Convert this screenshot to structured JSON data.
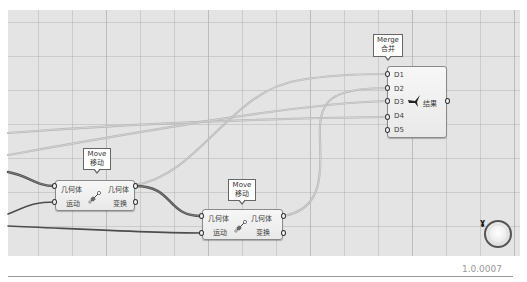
{
  "canvas": {
    "background": "#e4e4e4",
    "grid_color": "#a0a0a0"
  },
  "nodes": {
    "merge": {
      "tooltip_line1": "Merge",
      "tooltip_line2": "合并",
      "inputs": [
        "D1",
        "D2",
        "D3",
        "D4",
        "D5"
      ],
      "output": "结果",
      "icon": "merge-icon"
    },
    "move1": {
      "tooltip_line1": "Move",
      "tooltip_line2": "移动",
      "inputs": [
        "几何体",
        "运动"
      ],
      "outputs": [
        "几何体",
        "变换"
      ],
      "icon": "move-icon"
    },
    "move2": {
      "tooltip_line1": "Move",
      "tooltip_line2": "移动",
      "inputs": [
        "几何体",
        "运动"
      ],
      "outputs": [
        "几何体",
        "变换"
      ],
      "icon": "move-icon"
    }
  },
  "wires": {
    "dark_color": "#5a5a5a",
    "light_color": "#bdbdbd"
  },
  "status": {
    "version": "1.0.0007"
  },
  "navigation": {
    "icon": "navigation-wheel-icon"
  }
}
